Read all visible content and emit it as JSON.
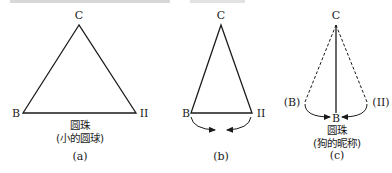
{
  "colors": {
    "stroke": "#1a1a1a",
    "background": "#ffffff"
  },
  "panels": [
    {
      "id": "a",
      "apex_label": "C",
      "left_label": "B",
      "right_label": "II",
      "caption_line1": "圆珠",
      "caption_line2": "(小的圆球)",
      "panel_label": "(a)"
    },
    {
      "id": "b",
      "apex_label": "C",
      "left_label": "B",
      "right_label": "II",
      "panel_label": "(b)"
    },
    {
      "id": "c",
      "apex_label": "C",
      "left_label": "(B)",
      "right_label": "(II)",
      "bottom_label": "B",
      "caption_line1": "圆珠",
      "caption_line2": "(狗的昵称)",
      "panel_label": "(c)"
    }
  ]
}
